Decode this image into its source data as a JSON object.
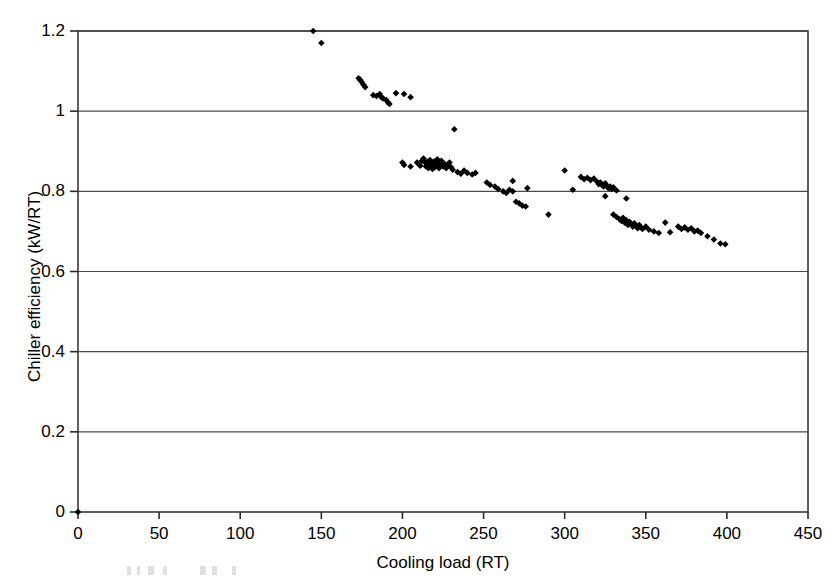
{
  "chart_data": {
    "type": "scatter",
    "title": "",
    "xlabel": "Cooling load (RT)",
    "ylabel": "Chiller efficiency (kW/RT)",
    "xlim": [
      0,
      450
    ],
    "ylim": [
      0,
      1.2
    ],
    "xticks": [
      0,
      50,
      100,
      150,
      200,
      250,
      300,
      350,
      400,
      450
    ],
    "xtick_labels": [
      "0",
      "50",
      "100",
      "150",
      "200",
      "250",
      "300",
      "350",
      "400",
      "450"
    ],
    "yticks": [
      0,
      0.2,
      0.4,
      0.6,
      0.8,
      1.0,
      1.2
    ],
    "ytick_labels": [
      "0",
      "0.2",
      "0.4",
      "0.6",
      "0.8",
      "1",
      "1.2"
    ],
    "grid": "horizontal",
    "legend": null,
    "marker": "diamond",
    "marker_color": "#000000",
    "points": [
      [
        0,
        0
      ],
      [
        145,
        1.2
      ],
      [
        150,
        1.17
      ],
      [
        173,
        1.082
      ],
      [
        174,
        1.078
      ],
      [
        175,
        1.072
      ],
      [
        176,
        1.066
      ],
      [
        177,
        1.06
      ],
      [
        182,
        1.04
      ],
      [
        184,
        1.038
      ],
      [
        186,
        1.043
      ],
      [
        187,
        1.035
      ],
      [
        188,
        1.032
      ],
      [
        190,
        1.028
      ],
      [
        191,
        1.022
      ],
      [
        192,
        1.018
      ],
      [
        196,
        1.045
      ],
      [
        201,
        1.043
      ],
      [
        205,
        1.035
      ],
      [
        200,
        0.872
      ],
      [
        201,
        0.866
      ],
      [
        205,
        0.862
      ],
      [
        209,
        0.872
      ],
      [
        210,
        0.868
      ],
      [
        211,
        0.864
      ],
      [
        212,
        0.876
      ],
      [
        213,
        0.882
      ],
      [
        214,
        0.872
      ],
      [
        214.5,
        0.862
      ],
      [
        215,
        0.868
      ],
      [
        215.5,
        0.874
      ],
      [
        216,
        0.858
      ],
      [
        216.5,
        0.866
      ],
      [
        217,
        0.878
      ],
      [
        217.5,
        0.87
      ],
      [
        218,
        0.862
      ],
      [
        218.5,
        0.856
      ],
      [
        219,
        0.868
      ],
      [
        219.5,
        0.874
      ],
      [
        220,
        0.86
      ],
      [
        220.5,
        0.866
      ],
      [
        221,
        0.872
      ],
      [
        221.5,
        0.88
      ],
      [
        222,
        0.864
      ],
      [
        222.5,
        0.858
      ],
      [
        223,
        0.87
      ],
      [
        224,
        0.876
      ],
      [
        225,
        0.862
      ],
      [
        226,
        0.868
      ],
      [
        227,
        0.858
      ],
      [
        228,
        0.866
      ],
      [
        229,
        0.872
      ],
      [
        230,
        0.86
      ],
      [
        231,
        0.854
      ],
      [
        232,
        0.955
      ],
      [
        234,
        0.848
      ],
      [
        236,
        0.844
      ],
      [
        238,
        0.852
      ],
      [
        240,
        0.846
      ],
      [
        243,
        0.842
      ],
      [
        245,
        0.846
      ],
      [
        252,
        0.822
      ],
      [
        254,
        0.816
      ],
      [
        257,
        0.812
      ],
      [
        259,
        0.806
      ],
      [
        262,
        0.8
      ],
      [
        264,
        0.796
      ],
      [
        266,
        0.804
      ],
      [
        268,
        0.8
      ],
      [
        270,
        0.774
      ],
      [
        272,
        0.77
      ],
      [
        274,
        0.764
      ],
      [
        276,
        0.762
      ],
      [
        268,
        0.826
      ],
      [
        277,
        0.808
      ],
      [
        290,
        0.742
      ],
      [
        300,
        0.852
      ],
      [
        305,
        0.804
      ],
      [
        310,
        0.836
      ],
      [
        312,
        0.83
      ],
      [
        314,
        0.834
      ],
      [
        316,
        0.828
      ],
      [
        318,
        0.832
      ],
      [
        320,
        0.824
      ],
      [
        321,
        0.818
      ],
      [
        322,
        0.822
      ],
      [
        323,
        0.816
      ],
      [
        324,
        0.812
      ],
      [
        325,
        0.82
      ],
      [
        326,
        0.814
      ],
      [
        327,
        0.808
      ],
      [
        328,
        0.812
      ],
      [
        329,
        0.806
      ],
      [
        330,
        0.81
      ],
      [
        332,
        0.802
      ],
      [
        325,
        0.788
      ],
      [
        338,
        0.782
      ],
      [
        330,
        0.742
      ],
      [
        332,
        0.736
      ],
      [
        334,
        0.73
      ],
      [
        335,
        0.726
      ],
      [
        336,
        0.734
      ],
      [
        337,
        0.722
      ],
      [
        338,
        0.728
      ],
      [
        339,
        0.716
      ],
      [
        340,
        0.724
      ],
      [
        341,
        0.718
      ],
      [
        342,
        0.712
      ],
      [
        343,
        0.72
      ],
      [
        344,
        0.714
      ],
      [
        345,
        0.708
      ],
      [
        346,
        0.716
      ],
      [
        347,
        0.71
      ],
      [
        348,
        0.706
      ],
      [
        350,
        0.712
      ],
      [
        352,
        0.704
      ],
      [
        355,
        0.7
      ],
      [
        358,
        0.696
      ],
      [
        362,
        0.722
      ],
      [
        365,
        0.698
      ],
      [
        370,
        0.712
      ],
      [
        372,
        0.706
      ],
      [
        374,
        0.71
      ],
      [
        376,
        0.704
      ],
      [
        378,
        0.708
      ],
      [
        380,
        0.7
      ],
      [
        382,
        0.702
      ],
      [
        384,
        0.696
      ],
      [
        388,
        0.688
      ],
      [
        392,
        0.68
      ],
      [
        396,
        0.67
      ],
      [
        399,
        0.668
      ]
    ]
  },
  "axes": {
    "y_title": "Chiller efficiency (kW/RT)",
    "x_title": "Cooling load (RT)"
  }
}
